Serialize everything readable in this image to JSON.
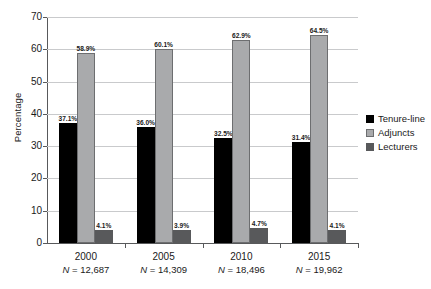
{
  "chart_data": {
    "type": "bar",
    "title": "",
    "xlabel": "",
    "ylabel": "Percentage",
    "ylim": [
      0,
      70
    ],
    "yticks": [
      0,
      10,
      20,
      30,
      40,
      50,
      60,
      70
    ],
    "ytick_labels": [
      "0",
      "10",
      "20",
      "30",
      "40",
      "50",
      "60",
      "70"
    ],
    "grid": "horizontal",
    "legend_position": "right",
    "categories": [
      "2000",
      "2005",
      "2010",
      "2015"
    ],
    "category_sublabels": [
      "N = 12,687",
      "N = 14,309",
      "N = 18,496",
      "N = 19,962"
    ],
    "sample_sizes": [
      12687,
      14309,
      18496,
      19962
    ],
    "series": [
      {
        "name": "Tenure-line",
        "color": "#000000",
        "values": [
          37.1,
          36.0,
          32.5,
          31.4
        ],
        "labels": [
          "37.1%",
          "36.0%",
          "32.5%",
          "31.4%"
        ]
      },
      {
        "name": "Adjuncts",
        "color": "#a9aaac",
        "values": [
          58.9,
          60.1,
          62.9,
          64.5
        ],
        "labels": [
          "58.9%",
          "60.1%",
          "62.9%",
          "64.5%"
        ]
      },
      {
        "name": "Lecturers",
        "color": "#58595b",
        "values": [
          4.1,
          3.9,
          4.7,
          4.1
        ],
        "labels": [
          "4.1%",
          "3.9%",
          "4.7%",
          "4.1%"
        ]
      }
    ]
  },
  "axes": {
    "y_title": "Percentage"
  },
  "legend": {
    "items": [
      {
        "label": "Tenure-line",
        "color": "#000000"
      },
      {
        "label": "Adjuncts",
        "color": "#a9aaac"
      },
      {
        "label": "Lecturers",
        "color": "#58595b"
      }
    ]
  },
  "xaxis": {
    "groups": [
      {
        "year": "2000",
        "n_label": "N = 12,687",
        "n_prefix": "N",
        "n_value": " = 12,687"
      },
      {
        "year": "2005",
        "n_label": "N = 14,309",
        "n_prefix": "N",
        "n_value": " = 14,309"
      },
      {
        "year": "2010",
        "n_label": "N = 18,496",
        "n_prefix": "N",
        "n_value": " = 18,496"
      },
      {
        "year": "2015",
        "n_label": "N = 19,962",
        "n_prefix": "N",
        "n_value": " = 19,962"
      }
    ]
  }
}
